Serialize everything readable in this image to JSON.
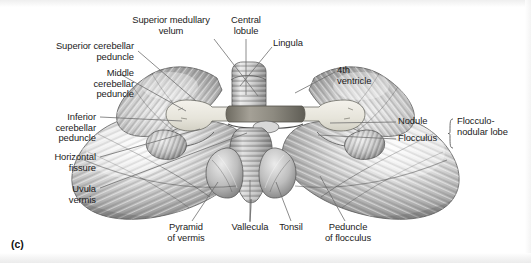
{
  "figure": {
    "panel_letter": "(c)",
    "colors": {
      "background": "#ffffff",
      "text": "#1b1b1b",
      "leader_line": "#6e6e6e",
      "cortex_light": "#f2f2f2",
      "cortex_mid": "#b8b8b8",
      "cortex_dark": "#6b6b6b",
      "peduncle_cut": "#eceae2",
      "vermis_shadow": "#8a8a8a"
    }
  },
  "labels": [
    {
      "id": "superior-medullary-velum",
      "text": "Superior medullary\nvelum",
      "align": "center",
      "x": 112,
      "y": 15,
      "w": 118,
      "leader": {
        "x1": 214,
        "y1": 39,
        "x2": 258,
        "y2": 96
      }
    },
    {
      "id": "central-lobule",
      "text": "Central\nlobule",
      "align": "center",
      "x": 219,
      "y": 15,
      "w": 54,
      "leader": {
        "x1": 246,
        "y1": 39,
        "x2": 246,
        "y2": 95
      }
    },
    {
      "id": "lingula",
      "text": "Lingula",
      "align": "left",
      "x": 273,
      "y": 38,
      "w": 60,
      "leader": {
        "x1": 272,
        "y1": 47,
        "x2": 240,
        "y2": 86
      }
    },
    {
      "id": "superior-cerebellar-peduncle",
      "text": "Superior cerebellar\npeduncle",
      "align": "right",
      "x": 24,
      "y": 41,
      "w": 110,
      "leader": {
        "x1": 138,
        "y1": 51,
        "x2": 196,
        "y2": 101
      }
    },
    {
      "id": "middle-cerebellar-peduncle",
      "text": "Middle\ncerebellar\npeduncle",
      "align": "right",
      "x": 24,
      "y": 68,
      "w": 110,
      "leader": {
        "x1": 120,
        "y1": 74,
        "x2": 186,
        "y2": 111
      }
    },
    {
      "id": "fourth-ventricle",
      "text": "4th\nventricle",
      "align": "left",
      "x": 337,
      "y": 65,
      "w": 62,
      "leader": {
        "x1": 335,
        "y1": 72,
        "x2": 295,
        "y2": 93
      }
    },
    {
      "id": "inferior-cerebellar-peduncle",
      "text": "Inferior\ncerebellar\npeduncle",
      "align": "right",
      "x": 18,
      "y": 112,
      "w": 78,
      "leader": {
        "x1": 100,
        "y1": 117,
        "x2": 182,
        "y2": 121
      }
    },
    {
      "id": "horizontal-fissure",
      "text": "Horizontal\nfissure",
      "align": "right",
      "x": 18,
      "y": 152,
      "w": 78,
      "leader": {
        "x1": 100,
        "y1": 157,
        "x2": 200,
        "y2": 129
      }
    },
    {
      "id": "uvula-vermis",
      "text": "Uvula\nvermis",
      "align": "right",
      "x": 18,
      "y": 184,
      "w": 78,
      "leader": {
        "x1": 100,
        "y1": 188,
        "x2": 247,
        "y2": 133
      }
    },
    {
      "id": "nodule",
      "text": "Nodule",
      "align": "left",
      "x": 398,
      "y": 116,
      "w": 52,
      "leader": {
        "x1": 396,
        "y1": 122,
        "x2": 330,
        "y2": 123
      }
    },
    {
      "id": "flocculus",
      "text": "Flocculus",
      "align": "left",
      "x": 398,
      "y": 133,
      "w": 52,
      "leader": {
        "x1": 396,
        "y1": 139,
        "x2": 318,
        "y2": 135
      }
    },
    {
      "id": "flocculonodular-lobe",
      "text": "Flocculo-\nnodular lobe",
      "align": "left",
      "x": 457,
      "y": 116,
      "w": 72,
      "leader": null
    },
    {
      "id": "pyramid-of-vermis",
      "text": "Pyramid\nof vermis",
      "align": "center",
      "x": 155,
      "y": 222,
      "w": 62,
      "leader": {
        "x1": 192,
        "y1": 221,
        "x2": 218,
        "y2": 182
      }
    },
    {
      "id": "vallecula",
      "text": "Vallecula",
      "align": "center",
      "x": 220,
      "y": 222,
      "w": 60,
      "leader": {
        "x1": 250,
        "y1": 221,
        "x2": 250,
        "y2": 180
      }
    },
    {
      "id": "tonsil",
      "text": "Tonsil",
      "align": "center",
      "x": 264,
      "y": 222,
      "w": 54,
      "leader": {
        "x1": 291,
        "y1": 221,
        "x2": 276,
        "y2": 182
      }
    },
    {
      "id": "peduncle-of-flocculus",
      "text": "Peduncle\nof flocculus",
      "align": "center",
      "x": 311,
      "y": 222,
      "w": 74,
      "leader": {
        "x1": 345,
        "y1": 221,
        "x2": 320,
        "y2": 176
      }
    }
  ],
  "brace": {
    "id": "flocculonodular-brace",
    "x": 450,
    "y_top": 116,
    "y_bottom": 145
  }
}
